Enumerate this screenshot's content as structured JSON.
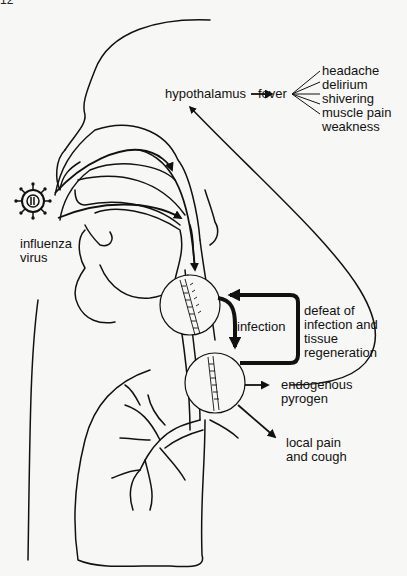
{
  "page": {
    "number_fragment": "12"
  },
  "labels": {
    "hypothalamus": "hypothalamus",
    "fever": "fever",
    "symptoms": [
      "headache",
      "delirium",
      "shivering",
      "muscle pain",
      "weakness"
    ],
    "influenza_virus": [
      "influenza",
      "virus"
    ],
    "infection": "infection",
    "defeat": [
      "defeat of",
      "infection and",
      "tissue",
      "regeneration"
    ],
    "endogenous_pyrogen": [
      "endogenous",
      "pyrogen"
    ],
    "local_pain": [
      "local pain",
      "and cough"
    ]
  },
  "colors": {
    "line": "#111111",
    "background": "#f7f7f5"
  }
}
